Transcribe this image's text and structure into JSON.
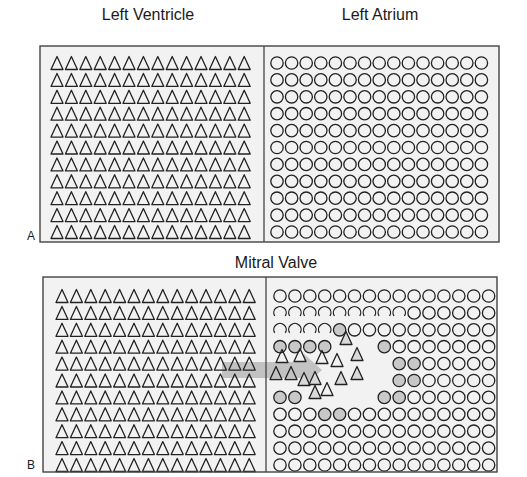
{
  "panel_a": {
    "label": "A",
    "left_title": "Left Ventricle",
    "right_title": "Left Atrium",
    "box": {
      "x": 40,
      "y": 46,
      "w": 459,
      "h": 196,
      "divider_x": 264
    },
    "left_grid": {
      "shape": "triangle",
      "cols": 14,
      "rows": 11,
      "x0": 57,
      "y0": 57,
      "dx": 14.4,
      "dy": 16.9
    },
    "right_grid": {
      "shape": "circle",
      "cols": 15,
      "rows": 11,
      "x0": 277,
      "y0": 57,
      "dx": 14.6,
      "dy": 16.9
    }
  },
  "panel_b": {
    "label": "B",
    "title": "Mitral Valve",
    "box": {
      "x": 43,
      "y": 277,
      "w": 454,
      "h": 195,
      "divider_x": 266
    },
    "left_grid": {
      "shape": "triangle",
      "cols": 14,
      "rows": 11,
      "x0": 62,
      "y0": 290,
      "dx": 14.4,
      "dy": 16.9
    },
    "right_grid": {
      "shape": "circle",
      "cols": 15,
      "rows": 11,
      "x0": 280,
      "y0": 290,
      "dx": 14.9,
      "dy": 16.9,
      "cell_states": [
        "ooooooooooooooo",
        "bbbbbbbbboooooo",
        "bbbbsoooooooooo",
        "ssss.~.sooooooo",
        "........ssooooo",
        "........ssooooo",
        "ss.....ssoooooo",
        "ooossoooooooooo",
        "ooooooooooooooo",
        "ooooooooooooooo",
        "ooooooooooooooo"
      ],
      "legend": {
        "o": "open circle",
        "s": "shaded circle",
        "b": "broken circle",
        ".": "empty (displaced)",
        "~": "empty"
      }
    },
    "displaced_triangles": [
      {
        "x": 346,
        "y": 338,
        "fill": "#d9d9d9"
      },
      {
        "x": 282,
        "y": 356
      },
      {
        "x": 300,
        "y": 355
      },
      {
        "x": 322,
        "y": 357
      },
      {
        "x": 337,
        "y": 360
      },
      {
        "x": 357,
        "y": 354,
        "fill": "#d9d9d9"
      },
      {
        "x": 276,
        "y": 373
      },
      {
        "x": 291,
        "y": 373
      },
      {
        "x": 304,
        "y": 379,
        "fill": "#d9d9d9"
      },
      {
        "x": 315,
        "y": 378,
        "fill": "#d9d9d9"
      },
      {
        "x": 341,
        "y": 378,
        "fill": "#d9d9d9"
      },
      {
        "x": 357,
        "y": 373,
        "fill": "#d9d9d9"
      },
      {
        "x": 315,
        "y": 392,
        "fill": "#d9d9d9"
      },
      {
        "x": 327,
        "y": 389
      }
    ],
    "arrow": {
      "x1": 222,
      "x2": 322,
      "y": 370,
      "thickness": 16,
      "color": "#9a9a9a",
      "opacity": 0.55
    }
  },
  "colors": {
    "panel_bg": "#f2f2f2",
    "stroke": "#222222",
    "shaded": "#c8c8c8",
    "border": "#444444"
  }
}
